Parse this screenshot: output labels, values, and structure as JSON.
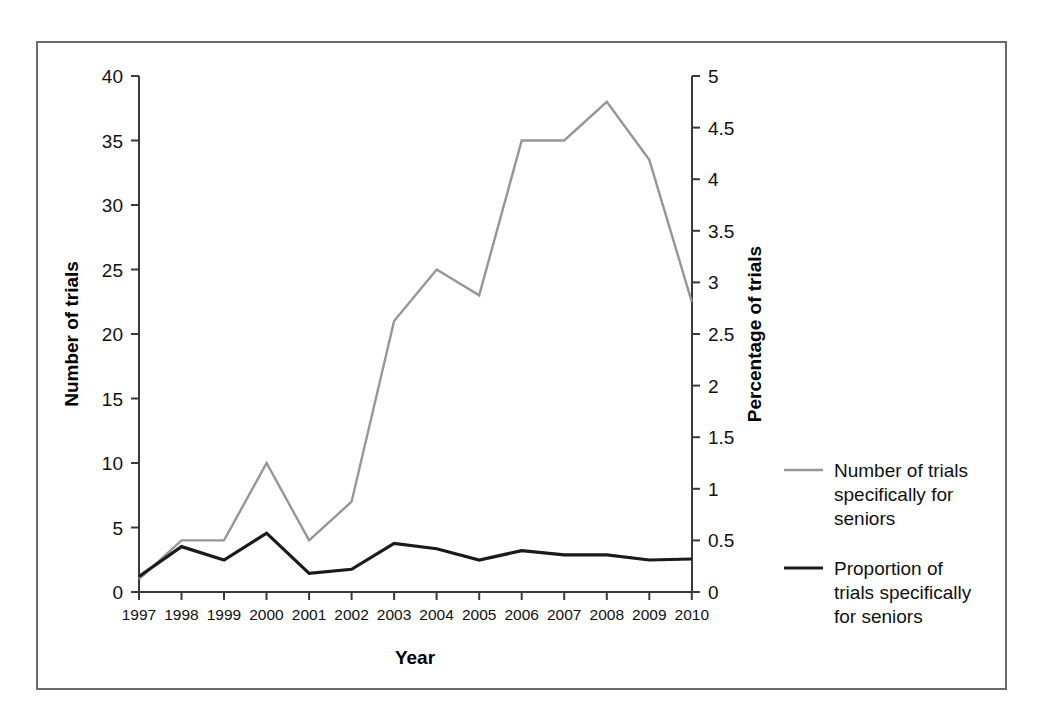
{
  "chart_data": {
    "type": "line",
    "title": "",
    "xlabel": "Year",
    "ylabel": "Number of trials",
    "y2label": "Percentage of trials",
    "categories": [
      "1997",
      "1998",
      "1999",
      "2000",
      "2001",
      "2002",
      "2003",
      "2004",
      "2005",
      "2006",
      "2007",
      "2008",
      "2009",
      "2010"
    ],
    "x": [
      1997,
      1998,
      1999,
      2000,
      2001,
      2002,
      2003,
      2004,
      2005,
      2006,
      2007,
      2008,
      2009,
      2010
    ],
    "ylim": [
      0,
      40
    ],
    "y2lim": [
      0,
      5
    ],
    "yticks": [
      "0",
      "5",
      "10",
      "15",
      "20",
      "25",
      "30",
      "35",
      "40"
    ],
    "y2ticks": [
      "0",
      "0.5",
      "1",
      "1.5",
      "2",
      "2.5",
      "3",
      "3.5",
      "4",
      "4.5",
      "5"
    ],
    "grid": false,
    "legend_position": "right",
    "series": [
      {
        "name": "Number of trials specifically for seniors",
        "axis": "left",
        "color": "#969696",
        "values": [
          1,
          4,
          4,
          10,
          4,
          7,
          21,
          25,
          23,
          35,
          35,
          38,
          33.5,
          22.5
        ]
      },
      {
        "name": "Proportion of trials specifically for seniors",
        "axis": "right",
        "color": "#1a1a1a",
        "values": [
          0.15,
          0.44,
          0.31,
          0.57,
          0.18,
          0.22,
          0.47,
          0.42,
          0.31,
          0.4,
          0.36,
          0.36,
          0.31,
          0.32
        ]
      }
    ]
  },
  "legend": {
    "entries": [
      {
        "label_line1": "Number of trials",
        "label_line2": "specifically for",
        "label_line3": "seniors",
        "color": "#969696"
      },
      {
        "label_line1": "Proportion of",
        "label_line2": "trials specifically",
        "label_line3": "for seniors",
        "color": "#1a1a1a"
      }
    ]
  },
  "axes": {
    "x_title": "Year",
    "y_left_title": "Number of trials",
    "y_right_title": "Percentage of trials"
  }
}
